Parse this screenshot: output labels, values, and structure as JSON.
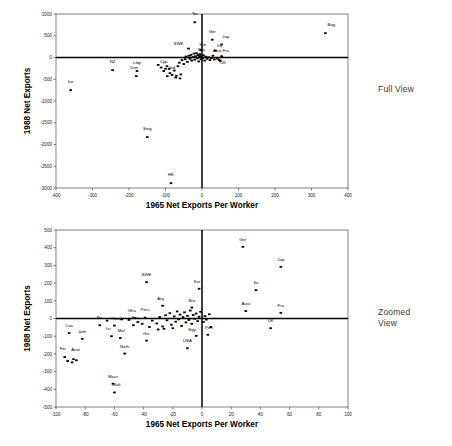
{
  "annotations": {
    "full_view": "Full View",
    "zoomed_view": "Zoomed\nView"
  },
  "chart_data": [
    {
      "id": "full",
      "type": "scatter",
      "title": "",
      "xlabel": "1965 Net Exports Per Worker",
      "ylabel": "1988 Net Exports",
      "xlim": [
        -400,
        400
      ],
      "ylim": [
        -3000,
        1000
      ],
      "xticks": [
        -400,
        -300,
        -200,
        -100,
        0,
        100,
        200,
        300,
        400
      ],
      "yticks": [
        1000,
        500,
        0,
        -500,
        -1000,
        -1500,
        -2000,
        -2500,
        -3000
      ],
      "grid": false,
      "legend": "none",
      "zero_lines": true,
      "points": [
        {
          "label": "Bag",
          "x": 338,
          "y": 560,
          "lx": 6,
          "ly": -7
        },
        {
          "label": "Tai",
          "x": -20,
          "y": 810,
          "lx": 0,
          "ly": -7
        },
        {
          "label": "Ger",
          "x": 28,
          "y": 410,
          "lx": 0,
          "ly": -7
        },
        {
          "label": "Jap",
          "x": 54,
          "y": 300,
          "lx": 4,
          "ly": -6
        },
        {
          "label": "SWE",
          "x": -37,
          "y": 205,
          "lx": -10,
          "ly": -4
        },
        {
          "label": "Kor",
          "x": -3,
          "y": 165,
          "lx": 2,
          "ly": -4
        },
        {
          "label": "Ita",
          "x": 37,
          "y": 160,
          "lx": 4,
          "ly": -4
        },
        {
          "label": "Aust",
          "x": 30,
          "y": 42,
          "lx": 4,
          "ly": -4
        },
        {
          "label": "Fra",
          "x": 54,
          "y": 30,
          "lx": 4,
          "ly": -4
        },
        {
          "label": "UK",
          "x": 47,
          "y": -55,
          "lx": 4,
          "ly": 4
        },
        {
          "label": "Bra",
          "x": -7,
          "y": 62,
          "lx": 2,
          "ly": -4
        },
        {
          "label": "NZ",
          "x": -245,
          "y": -290,
          "lx": 0,
          "ly": -7
        },
        {
          "label": "Liby",
          "x": -178,
          "y": -310,
          "lx": 0,
          "ly": -7
        },
        {
          "label": "Den",
          "x": -180,
          "y": -430,
          "lx": -2,
          "ly": -7
        },
        {
          "label": "Ice",
          "x": -360,
          "y": -750,
          "lx": 0,
          "ly": -7
        },
        {
          "label": "Sing",
          "x": -150,
          "y": -1830,
          "lx": 0,
          "ly": -7
        },
        {
          "label": "HK",
          "x": -85,
          "y": -2890,
          "lx": 0,
          "ly": -7
        },
        {
          "label": "Cyp",
          "x": -100,
          "y": -260,
          "lx": -2,
          "ly": -6
        },
        {
          "label": "Ind",
          "x": -82,
          "y": -400,
          "lx": 0,
          "ly": -6
        },
        {
          "label": "",
          "x": -120,
          "y": -170,
          "lx": 0,
          "ly": 0
        },
        {
          "label": "",
          "x": -112,
          "y": -230,
          "lx": 0,
          "ly": 0
        },
        {
          "label": "",
          "x": -105,
          "y": -310,
          "lx": 0,
          "ly": 0
        },
        {
          "label": "",
          "x": -96,
          "y": -200,
          "lx": 0,
          "ly": 0
        },
        {
          "label": "",
          "x": -90,
          "y": -260,
          "lx": 0,
          "ly": 0
        },
        {
          "label": "",
          "x": -88,
          "y": -360,
          "lx": 0,
          "ly": 0
        },
        {
          "label": "",
          "x": -76,
          "y": -300,
          "lx": 0,
          "ly": 0
        },
        {
          "label": "",
          "x": -70,
          "y": -420,
          "lx": 0,
          "ly": 0
        },
        {
          "label": "",
          "x": -66,
          "y": -200,
          "lx": 0,
          "ly": 0
        },
        {
          "label": "",
          "x": -62,
          "y": -120,
          "lx": 0,
          "ly": 0
        },
        {
          "label": "",
          "x": -58,
          "y": -390,
          "lx": 0,
          "ly": 0
        },
        {
          "label": "",
          "x": -55,
          "y": -60,
          "lx": 0,
          "ly": 0
        },
        {
          "label": "",
          "x": -50,
          "y": -150,
          "lx": 0,
          "ly": 0
        },
        {
          "label": "",
          "x": -46,
          "y": -40,
          "lx": 0,
          "ly": 0
        },
        {
          "label": "",
          "x": -44,
          "y": 20,
          "lx": 0,
          "ly": 0
        },
        {
          "label": "",
          "x": -40,
          "y": -100,
          "lx": 0,
          "ly": 0
        },
        {
          "label": "",
          "x": -36,
          "y": 40,
          "lx": 0,
          "ly": 0
        },
        {
          "label": "",
          "x": -33,
          "y": -30,
          "lx": 0,
          "ly": 0
        },
        {
          "label": "",
          "x": -30,
          "y": 60,
          "lx": 0,
          "ly": 0
        },
        {
          "label": "",
          "x": -28,
          "y": -70,
          "lx": 0,
          "ly": 0
        },
        {
          "label": "",
          "x": -25,
          "y": 10,
          "lx": 0,
          "ly": 0
        },
        {
          "label": "",
          "x": -22,
          "y": 90,
          "lx": 0,
          "ly": 0
        },
        {
          "label": "",
          "x": -20,
          "y": -50,
          "lx": 0,
          "ly": 0
        },
        {
          "label": "",
          "x": -18,
          "y": 30,
          "lx": 0,
          "ly": 0
        },
        {
          "label": "",
          "x": -15,
          "y": 100,
          "lx": 0,
          "ly": 0
        },
        {
          "label": "",
          "x": -13,
          "y": -20,
          "lx": 0,
          "ly": 0
        },
        {
          "label": "",
          "x": -11,
          "y": 55,
          "lx": 0,
          "ly": 0
        },
        {
          "label": "",
          "x": -9,
          "y": -90,
          "lx": 0,
          "ly": 0
        },
        {
          "label": "",
          "x": -7,
          "y": 15,
          "lx": 0,
          "ly": 0
        },
        {
          "label": "",
          "x": -5,
          "y": 75,
          "lx": 0,
          "ly": 0
        },
        {
          "label": "",
          "x": -3,
          "y": -40,
          "lx": 0,
          "ly": 0
        },
        {
          "label": "",
          "x": -1,
          "y": 35,
          "lx": 0,
          "ly": 0
        },
        {
          "label": "",
          "x": 2,
          "y": -10,
          "lx": 0,
          "ly": 0
        },
        {
          "label": "",
          "x": 4,
          "y": 50,
          "lx": 0,
          "ly": 0
        },
        {
          "label": "",
          "x": 7,
          "y": -70,
          "lx": 0,
          "ly": 0
        },
        {
          "label": "",
          "x": 10,
          "y": 20,
          "lx": 0,
          "ly": 0
        },
        {
          "label": "",
          "x": 14,
          "y": -30,
          "lx": 0,
          "ly": 0
        },
        {
          "label": "",
          "x": 18,
          "y": 5,
          "lx": 0,
          "ly": 0
        },
        {
          "label": "",
          "x": 22,
          "y": -60,
          "lx": 0,
          "ly": 0
        },
        {
          "label": "",
          "x": 26,
          "y": -15,
          "lx": 0,
          "ly": 0
        },
        {
          "label": "",
          "x": 34,
          "y": -45,
          "lx": 0,
          "ly": 0
        },
        {
          "label": "",
          "x": 42,
          "y": -25,
          "lx": 0,
          "ly": 0
        },
        {
          "label": "",
          "x": 50,
          "y": -80,
          "lx": 0,
          "ly": 0
        },
        {
          "label": "",
          "x": -60,
          "y": -480,
          "lx": 0,
          "ly": 0
        },
        {
          "label": "",
          "x": -72,
          "y": -460,
          "lx": 0,
          "ly": 0
        },
        {
          "label": "",
          "x": -95,
          "y": -430,
          "lx": 0,
          "ly": 0
        }
      ]
    },
    {
      "id": "zoom",
      "type": "scatter",
      "title": "",
      "xlabel": "1965 Net Exports Per Worker",
      "ylabel": "1988 Net Exports",
      "xlim": [
        -100,
        100
      ],
      "ylim": [
        -500,
        500
      ],
      "xticks": [
        -100,
        -80,
        -60,
        -40,
        -20,
        0,
        20,
        40,
        60,
        80,
        100
      ],
      "yticks": [
        500,
        400,
        300,
        200,
        100,
        0,
        -100,
        -200,
        -300,
        -400,
        -500
      ],
      "grid": false,
      "legend": "none",
      "zero_lines": true,
      "points": [
        {
          "label": "Ger",
          "x": 28,
          "y": 405,
          "lx": 0,
          "ly": -6
        },
        {
          "label": "Jap",
          "x": 54,
          "y": 292,
          "lx": 0,
          "ly": -6
        },
        {
          "label": "Ita",
          "x": 37,
          "y": 160,
          "lx": 0,
          "ly": -6
        },
        {
          "label": "SWE",
          "x": -38,
          "y": 205,
          "lx": 0,
          "ly": -6
        },
        {
          "label": "Kor",
          "x": -2,
          "y": 168,
          "lx": -2,
          "ly": -6
        },
        {
          "label": "Aust",
          "x": 30,
          "y": 42,
          "lx": 0,
          "ly": -6
        },
        {
          "label": "Fra",
          "x": 54,
          "y": 32,
          "lx": 0,
          "ly": -6
        },
        {
          "label": "UK",
          "x": 47,
          "y": -55,
          "lx": 0,
          "ly": -6
        },
        {
          "label": "Bra",
          "x": -7,
          "y": 62,
          "lx": 0,
          "ly": -6
        },
        {
          "label": "Arg",
          "x": -27,
          "y": 72,
          "lx": -2,
          "ly": -6
        },
        {
          "label": "Gha",
          "x": -46,
          "y": 2,
          "lx": -3,
          "ly": -6
        },
        {
          "label": "Peru",
          "x": -39,
          "y": 5,
          "lx": 0,
          "ly": -7
        },
        {
          "label": "Port",
          "x": 4,
          "y": -92,
          "lx": 1,
          "ly": -6
        },
        {
          "label": "Egy",
          "x": -4,
          "y": -98,
          "lx": -4,
          "ly": -5
        },
        {
          "label": "USA",
          "x": -10,
          "y": -168,
          "lx": 0,
          "ly": -6
        },
        {
          "label": "Cos",
          "x": -91,
          "y": -82,
          "lx": 0,
          "ly": -6
        },
        {
          "label": "Jam",
          "x": -82,
          "y": -115,
          "lx": 0,
          "ly": -6
        },
        {
          "label": "Isr",
          "x": -62,
          "y": -100,
          "lx": -3,
          "ly": -6
        },
        {
          "label": "Mal",
          "x": -56,
          "y": -110,
          "lx": 1,
          "ly": -6
        },
        {
          "label": "Grc",
          "x": -38,
          "y": -125,
          "lx": 0,
          "ly": -6
        },
        {
          "label": "Fin",
          "x": -94,
          "y": -218,
          "lx": -2,
          "ly": -7
        },
        {
          "label": "Aust",
          "x": -88,
          "y": -230,
          "lx": 2,
          "ly": -8
        },
        {
          "label": "Neth",
          "x": -53,
          "y": -198,
          "lx": 0,
          "ly": -6
        },
        {
          "label": "Maur",
          "x": -61,
          "y": -368,
          "lx": 0,
          "ly": -6
        },
        {
          "label": "Malt",
          "x": -60,
          "y": -418,
          "lx": 2,
          "ly": -6
        },
        {
          "label": "Nic",
          "x": -70,
          "y": -38,
          "lx": 0,
          "ly": -6
        },
        {
          "label": "Hond",
          "x": -60,
          "y": -40,
          "lx": 2,
          "ly": -6
        },
        {
          "label": "Ecu",
          "x": -47,
          "y": -38,
          "lx": 2,
          "ly": -6
        },
        {
          "label": "",
          "x": -92,
          "y": -240,
          "lx": 0,
          "ly": 0
        },
        {
          "label": "",
          "x": -89,
          "y": -248,
          "lx": 0,
          "ly": 0
        },
        {
          "label": "",
          "x": -86,
          "y": -236,
          "lx": 0,
          "ly": 0
        },
        {
          "label": "",
          "x": -34,
          "y": -12,
          "lx": 0,
          "ly": 0
        },
        {
          "label": "",
          "x": -31,
          "y": -28,
          "lx": 0,
          "ly": 0
        },
        {
          "label": "",
          "x": -29,
          "y": 8,
          "lx": 0,
          "ly": 0
        },
        {
          "label": "",
          "x": -27,
          "y": -45,
          "lx": 0,
          "ly": 0
        },
        {
          "label": "",
          "x": -25,
          "y": 18,
          "lx": 0,
          "ly": 0
        },
        {
          "label": "",
          "x": -24,
          "y": -10,
          "lx": 0,
          "ly": 0
        },
        {
          "label": "",
          "x": -22,
          "y": 30,
          "lx": 0,
          "ly": 0
        },
        {
          "label": "",
          "x": -21,
          "y": -35,
          "lx": 0,
          "ly": 0
        },
        {
          "label": "",
          "x": -19,
          "y": 12,
          "lx": 0,
          "ly": 0
        },
        {
          "label": "",
          "x": -18,
          "y": -18,
          "lx": 0,
          "ly": 0
        },
        {
          "label": "",
          "x": -17,
          "y": 40,
          "lx": 0,
          "ly": 0
        },
        {
          "label": "",
          "x": -16,
          "y": -5,
          "lx": 0,
          "ly": 0
        },
        {
          "label": "",
          "x": -15,
          "y": 22,
          "lx": 0,
          "ly": 0
        },
        {
          "label": "",
          "x": -14,
          "y": -42,
          "lx": 0,
          "ly": 0
        },
        {
          "label": "",
          "x": -13,
          "y": 8,
          "lx": 0,
          "ly": 0
        },
        {
          "label": "",
          "x": -12,
          "y": 35,
          "lx": 0,
          "ly": 0
        },
        {
          "label": "",
          "x": -11,
          "y": -22,
          "lx": 0,
          "ly": 0
        },
        {
          "label": "",
          "x": -10,
          "y": 15,
          "lx": 0,
          "ly": 0
        },
        {
          "label": "",
          "x": -9,
          "y": -8,
          "lx": 0,
          "ly": 0
        },
        {
          "label": "",
          "x": -8,
          "y": 45,
          "lx": 0,
          "ly": 0
        },
        {
          "label": "",
          "x": -7,
          "y": -30,
          "lx": 0,
          "ly": 0
        },
        {
          "label": "",
          "x": -6,
          "y": 20,
          "lx": 0,
          "ly": 0
        },
        {
          "label": "",
          "x": -5,
          "y": -2,
          "lx": 0,
          "ly": 0
        },
        {
          "label": "",
          "x": -4,
          "y": 28,
          "lx": 0,
          "ly": 0
        },
        {
          "label": "",
          "x": -3,
          "y": -15,
          "lx": 0,
          "ly": 0
        },
        {
          "label": "",
          "x": -2,
          "y": 10,
          "lx": 0,
          "ly": 0
        },
        {
          "label": "",
          "x": -1,
          "y": 38,
          "lx": 0,
          "ly": 0
        },
        {
          "label": "",
          "x": 1,
          "y": -20,
          "lx": 0,
          "ly": 0
        },
        {
          "label": "",
          "x": 2,
          "y": 14,
          "lx": 0,
          "ly": 0
        },
        {
          "label": "",
          "x": 3,
          "y": -6,
          "lx": 0,
          "ly": 0
        },
        {
          "label": "",
          "x": 5,
          "y": 24,
          "lx": 0,
          "ly": 0
        },
        {
          "label": "",
          "x": 6,
          "y": -48,
          "lx": 0,
          "ly": 0
        },
        {
          "label": "",
          "x": -44,
          "y": -20,
          "lx": 0,
          "ly": 0
        },
        {
          "label": "",
          "x": -41,
          "y": -30,
          "lx": 0,
          "ly": 0
        },
        {
          "label": "",
          "x": -36,
          "y": -48,
          "lx": 0,
          "ly": 0
        },
        {
          "label": "",
          "x": -50,
          "y": -8,
          "lx": 0,
          "ly": 0
        },
        {
          "label": "",
          "x": -55,
          "y": -5,
          "lx": 0,
          "ly": 0
        },
        {
          "label": "",
          "x": -65,
          "y": -12,
          "lx": 0,
          "ly": 0
        },
        {
          "label": "",
          "x": -20,
          "y": -55,
          "lx": 0,
          "ly": 0
        },
        {
          "label": "",
          "x": -26,
          "y": -58,
          "lx": 0,
          "ly": 0
        },
        {
          "label": "",
          "x": -30,
          "y": -62,
          "lx": 0,
          "ly": 0
        }
      ]
    }
  ]
}
